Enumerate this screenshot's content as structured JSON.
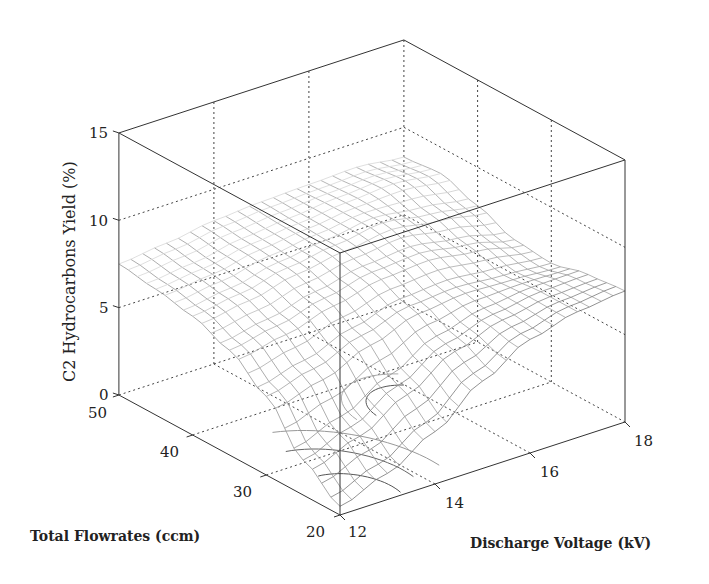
{
  "chart_data": {
    "type": "surface3d",
    "title": "",
    "xlabel": "Discharge Voltage (kV)",
    "ylabel": "Total Flowrates (ccm)",
    "zlabel": "C2 Hydrocarbons Yield (%)",
    "x_ticks": [
      12,
      14,
      16,
      18
    ],
    "y_ticks": [
      20,
      30,
      40,
      50
    ],
    "z_ticks": [
      0,
      5,
      10,
      15
    ],
    "xlim": [
      12,
      18
    ],
    "ylim": [
      20,
      50
    ],
    "zlim": [
      0,
      15
    ],
    "grid": true,
    "surface": {
      "description": "Wireframe mesh surface with contour projection on base plane",
      "x": [
        12,
        13,
        14,
        15,
        16,
        17,
        18
      ],
      "y": [
        20,
        25,
        30,
        35,
        40,
        45,
        50
      ],
      "z": [
        [
          0.5,
          2.0,
          4.5,
          6.0,
          6.8,
          7.2,
          7.5
        ],
        [
          1.5,
          3.0,
          5.2,
          6.5,
          7.2,
          7.5,
          7.8
        ],
        [
          3.0,
          4.5,
          6.2,
          7.2,
          7.8,
          8.0,
          8.2
        ],
        [
          5.0,
          6.0,
          7.0,
          7.8,
          8.2,
          8.3,
          8.4
        ],
        [
          6.5,
          6.8,
          7.2,
          8.0,
          8.6,
          8.6,
          8.5
        ],
        [
          7.2,
          7.2,
          7.0,
          7.6,
          8.2,
          8.8,
          8.6
        ],
        [
          7.5,
          7.3,
          6.8,
          7.0,
          7.8,
          8.5,
          8.3
        ]
      ],
      "notes": "z[row=voltage index][col=flowrate index]; minimum ~0% at 12 kV / 20 ccm, plateau ~8-9% at high flowrates, local hump ~8.5% near 16-17 kV"
    }
  },
  "labels": {
    "z_axis_title": "C2 Hydrocarbons Yield (%)",
    "flow_axis_title": "Total Flowrates (ccm)",
    "voltage_axis_title": "Discharge Voltage (kV)",
    "z_ticks": [
      "0",
      "5",
      "10",
      "15"
    ],
    "flow_ticks": [
      "20",
      "30",
      "40",
      "50"
    ],
    "voltage_ticks": [
      "12",
      "14",
      "16",
      "18"
    ]
  },
  "colors": {
    "axis": "#333333",
    "grid": "#444444",
    "mesh_dark": "#6a6a6a",
    "mesh_light": "#c8c8c8",
    "contour": "#555555"
  }
}
